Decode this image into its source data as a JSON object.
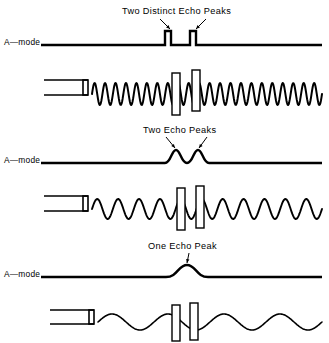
{
  "figure": {
    "width": 329,
    "height": 343,
    "background": "#ffffff",
    "ink": "#000000"
  },
  "panels": [
    {
      "id": "panel-distinct",
      "caption": "Two Distinct Echo Peaks",
      "caption_x": 122,
      "caption_y": 6,
      "amode_label": "A—mode",
      "amode_label_x": 4,
      "amode_label_y": 37,
      "baseline_y": 45,
      "baseline_x_start": 41,
      "baseline_x_end": 322,
      "peak_style": "square",
      "peak_height": 14,
      "peak_width": 6,
      "peaks_x": [
        168,
        193
      ],
      "arrows": [
        {
          "x1": 160,
          "y1": 19,
          "x2": 170,
          "y2": 29
        },
        {
          "x1": 206,
          "y1": 19,
          "x2": 196,
          "y2": 29
        }
      ],
      "transducer": {
        "x": 44,
        "y": 80,
        "w": 44,
        "h": 15,
        "tip_w": 5
      },
      "wave": {
        "y_center": 94,
        "x_start": 92,
        "x_end": 322,
        "amplitude": 11,
        "cycles": 22,
        "stroke": 2.0
      },
      "reflectors": [
        {
          "x": 172,
          "y": 73,
          "w": 8,
          "h": 42
        },
        {
          "x": 192,
          "y": 70,
          "w": 8,
          "h": 41
        }
      ]
    },
    {
      "id": "panel-two-peaks",
      "caption": "Two Echo Peaks",
      "caption_x": 143,
      "caption_y": 125,
      "amode_label": "A—mode",
      "amode_label_x": 4,
      "amode_label_y": 155,
      "baseline_y": 163,
      "baseline_x_start": 41,
      "baseline_x_end": 322,
      "peak_style": "round",
      "peak_height": 13,
      "peak_width": 22,
      "peaks_x": [
        176,
        198
      ],
      "arrows": [
        {
          "x1": 166,
          "y1": 137,
          "x2": 175,
          "y2": 148
        },
        {
          "x1": 207,
          "y1": 137,
          "x2": 199,
          "y2": 148
        }
      ],
      "transducer": {
        "x": 44,
        "y": 196,
        "w": 44,
        "h": 15,
        "tip_w": 5
      },
      "wave": {
        "y_center": 209,
        "x_start": 92,
        "x_end": 322,
        "amplitude": 10,
        "cycles": 11,
        "stroke": 1.9
      },
      "reflectors": [
        {
          "x": 177,
          "y": 188,
          "w": 8,
          "h": 42
        },
        {
          "x": 196,
          "y": 186,
          "w": 8,
          "h": 42
        }
      ]
    },
    {
      "id": "panel-one-peak",
      "caption": "One Echo Peak",
      "caption_x": 148,
      "caption_y": 241,
      "amode_label": "A—mode",
      "amode_label_x": 4,
      "amode_label_y": 269,
      "baseline_y": 277,
      "baseline_x_start": 41,
      "baseline_x_end": 322,
      "peak_style": "round",
      "peak_height": 12,
      "peak_width": 42,
      "peaks_x": [
        187
      ],
      "arrows": [
        {
          "x1": 189,
          "y1": 253,
          "x2": 187,
          "y2": 263
        }
      ],
      "transducer": {
        "x": 50,
        "y": 310,
        "w": 44,
        "h": 14,
        "tip_w": 5
      },
      "wave": {
        "y_center": 322,
        "x_start": 98,
        "x_end": 322,
        "amplitude": 8,
        "cycles": 4,
        "stroke": 1.6
      },
      "reflectors": [
        {
          "x": 172,
          "y": 305,
          "w": 8,
          "h": 36
        },
        {
          "x": 190,
          "y": 303,
          "w": 8,
          "h": 37
        }
      ]
    }
  ]
}
